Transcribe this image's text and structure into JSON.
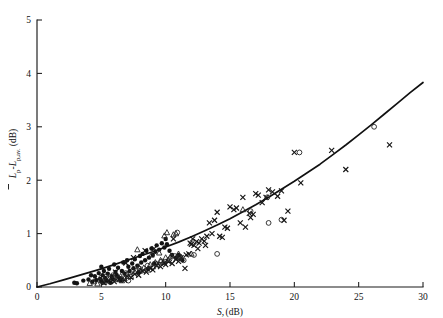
{
  "chart_data": {
    "type": "scatter",
    "title": "",
    "xlabel": "S, (dB)",
    "xlabel_main": "S,",
    "xlabel_unit": "(dB)",
    "ylabel": "L̄p-Lp,av. (dB)",
    "ylabel_main": "L",
    "ylabel_sub1": "p",
    "ylabel_mid": "-L",
    "ylabel_sub2": "p,av.",
    "ylabel_unit": "(dB)",
    "xlim": [
      0,
      30
    ],
    "ylim": [
      0,
      5
    ],
    "xticks": [
      0,
      5,
      10,
      15,
      20,
      25,
      30
    ],
    "yticks": [
      0,
      1,
      2,
      3,
      4,
      5
    ],
    "xtick_labels": [
      "0",
      "5",
      "10",
      "15",
      "20",
      "25",
      "30"
    ],
    "ytick_labels": [
      "0",
      "1",
      "2",
      "3",
      "4",
      "5"
    ],
    "grid": false,
    "legend": "none",
    "axis_color": "#1a1a1a",
    "marker_color": "#151515",
    "curve_color": "#111111",
    "curve": {
      "name": "fitted trend",
      "description": "monotonic increasing curve from origin, slightly concave up at high S",
      "points": [
        [
          0.0,
          0.0
        ],
        [
          1.0,
          0.06
        ],
        [
          2.0,
          0.13
        ],
        [
          3.0,
          0.2
        ],
        [
          4.0,
          0.27
        ],
        [
          5.0,
          0.34
        ],
        [
          6.0,
          0.42
        ],
        [
          7.0,
          0.5
        ],
        [
          8.0,
          0.58
        ],
        [
          9.0,
          0.66
        ],
        [
          10.0,
          0.75
        ],
        [
          11.0,
          0.84
        ],
        [
          12.0,
          0.94
        ],
        [
          13.0,
          1.05
        ],
        [
          14.0,
          1.16
        ],
        [
          15.0,
          1.28
        ],
        [
          16.0,
          1.41
        ],
        [
          17.0,
          1.54
        ],
        [
          18.0,
          1.68
        ],
        [
          19.0,
          1.83
        ],
        [
          20.0,
          1.98
        ],
        [
          21.0,
          2.14
        ],
        [
          22.0,
          2.3
        ],
        [
          23.0,
          2.48
        ],
        [
          24.0,
          2.66
        ],
        [
          25.0,
          2.85
        ],
        [
          26.0,
          3.04
        ],
        [
          27.0,
          3.24
        ],
        [
          28.0,
          3.44
        ],
        [
          29.0,
          3.64
        ],
        [
          30.0,
          3.83
        ]
      ]
    },
    "series": [
      {
        "name": "filled-circle",
        "marker": "circle-filled",
        "points": [
          [
            2.9,
            0.08
          ],
          [
            3.1,
            0.07
          ],
          [
            3.6,
            0.12
          ],
          [
            4.0,
            0.14
          ],
          [
            4.3,
            0.1
          ],
          [
            4.5,
            0.2
          ],
          [
            4.6,
            0.13
          ],
          [
            4.8,
            0.26
          ],
          [
            4.9,
            0.15
          ],
          [
            5.0,
            0.1
          ],
          [
            5.1,
            0.22
          ],
          [
            5.2,
            0.3
          ],
          [
            5.3,
            0.17
          ],
          [
            5.4,
            0.12
          ],
          [
            5.5,
            0.25
          ],
          [
            5.6,
            0.34
          ],
          [
            5.8,
            0.2
          ],
          [
            5.9,
            0.15
          ],
          [
            6.0,
            0.42
          ],
          [
            6.1,
            0.28
          ],
          [
            6.2,
            0.22
          ],
          [
            6.3,
            0.36
          ],
          [
            6.4,
            0.17
          ],
          [
            6.6,
            0.3
          ],
          [
            6.7,
            0.46
          ],
          [
            6.8,
            0.25
          ],
          [
            7.0,
            0.5
          ],
          [
            7.1,
            0.38
          ],
          [
            7.2,
            0.3
          ],
          [
            7.4,
            0.44
          ],
          [
            7.5,
            0.35
          ],
          [
            7.6,
            0.52
          ],
          [
            7.8,
            0.4
          ],
          [
            8.0,
            0.58
          ],
          [
            8.1,
            0.46
          ],
          [
            8.2,
            0.62
          ],
          [
            8.4,
            0.5
          ],
          [
            8.5,
            0.68
          ],
          [
            8.7,
            0.55
          ],
          [
            8.9,
            0.72
          ],
          [
            9.0,
            0.6
          ],
          [
            9.2,
            0.66
          ],
          [
            9.3,
            0.78
          ],
          [
            9.5,
            0.7
          ],
          [
            9.7,
            0.82
          ],
          [
            9.9,
            0.74
          ],
          [
            10.0,
            0.9
          ],
          [
            10.1,
            0.8
          ],
          [
            10.3,
            0.68
          ],
          [
            10.5,
            0.6
          ],
          [
            5.0,
            0.38
          ],
          [
            5.7,
            0.08
          ],
          [
            6.5,
            0.12
          ],
          [
            4.2,
            0.22
          ],
          [
            11.0,
            0.6
          ],
          [
            11.3,
            0.5
          ],
          [
            10.8,
            0.55
          ],
          [
            7.9,
            0.28
          ],
          [
            8.6,
            0.34
          ],
          [
            9.1,
            0.44
          ]
        ]
      },
      {
        "name": "open-triangle",
        "marker": "triangle-open",
        "points": [
          [
            4.1,
            0.07
          ],
          [
            4.4,
            0.1
          ],
          [
            4.7,
            0.06
          ],
          [
            5.0,
            0.13
          ],
          [
            5.2,
            0.09
          ],
          [
            5.5,
            0.16
          ],
          [
            5.7,
            0.11
          ],
          [
            6.0,
            0.18
          ],
          [
            6.2,
            0.14
          ],
          [
            6.5,
            0.2
          ],
          [
            6.8,
            0.16
          ],
          [
            7.0,
            0.24
          ],
          [
            7.3,
            0.2
          ],
          [
            7.6,
            0.28
          ],
          [
            7.8,
            0.7
          ],
          [
            8.0,
            0.3
          ],
          [
            8.3,
            0.36
          ],
          [
            8.6,
            0.32
          ],
          [
            8.8,
            0.42
          ],
          [
            9.0,
            0.38
          ],
          [
            9.2,
            0.46
          ],
          [
            9.4,
            0.42
          ],
          [
            9.6,
            0.5
          ],
          [
            9.8,
            0.46
          ],
          [
            10.0,
            0.55
          ],
          [
            10.2,
            0.5
          ],
          [
            10.4,
            0.58
          ],
          [
            10.6,
            0.98
          ],
          [
            10.8,
            1.0
          ],
          [
            11.0,
            0.62
          ],
          [
            11.2,
            0.56
          ],
          [
            12.0,
            0.62
          ],
          [
            10.1,
            1.02
          ],
          [
            9.9,
            0.96
          ],
          [
            8.9,
            0.6
          ],
          [
            9.5,
            0.64
          ],
          [
            10.9,
            0.55
          ],
          [
            6.6,
            0.12
          ],
          [
            7.9,
            0.38
          ],
          [
            16.0,
            1.45
          ]
        ]
      },
      {
        "name": "cross",
        "marker": "cross",
        "points": [
          [
            5.2,
            0.08
          ],
          [
            5.6,
            0.12
          ],
          [
            6.0,
            0.1
          ],
          [
            6.4,
            0.15
          ],
          [
            6.8,
            0.13
          ],
          [
            7.0,
            0.2
          ],
          [
            7.3,
            0.18
          ],
          [
            7.6,
            0.24
          ],
          [
            7.9,
            0.22
          ],
          [
            8.2,
            0.3
          ],
          [
            8.5,
            0.28
          ],
          [
            8.8,
            0.35
          ],
          [
            9.0,
            0.32
          ],
          [
            9.3,
            0.4
          ],
          [
            9.6,
            0.38
          ],
          [
            9.9,
            0.45
          ],
          [
            10.0,
            0.42
          ],
          [
            10.2,
            0.48
          ],
          [
            10.5,
            0.44
          ],
          [
            10.8,
            0.52
          ],
          [
            11.0,
            0.48
          ],
          [
            11.2,
            0.55
          ],
          [
            11.5,
            0.35
          ],
          [
            11.8,
            0.62
          ],
          [
            12.0,
            0.8
          ],
          [
            12.2,
            0.78
          ],
          [
            12.4,
            0.85
          ],
          [
            12.6,
            0.82
          ],
          [
            12.8,
            0.9
          ],
          [
            13.0,
            0.86
          ],
          [
            13.2,
            0.95
          ],
          [
            13.4,
            1.2
          ],
          [
            13.6,
            1.0
          ],
          [
            14.0,
            1.4
          ],
          [
            14.2,
            0.95
          ],
          [
            14.4,
            0.93
          ],
          [
            14.6,
            1.12
          ],
          [
            14.8,
            1.1
          ],
          [
            15.0,
            1.5
          ],
          [
            15.3,
            1.45
          ],
          [
            15.8,
            1.2
          ],
          [
            16.0,
            1.68
          ],
          [
            16.2,
            1.12
          ],
          [
            16.5,
            1.38
          ],
          [
            16.8,
            1.36
          ],
          [
            17.0,
            1.75
          ],
          [
            17.2,
            1.72
          ],
          [
            17.5,
            1.58
          ],
          [
            17.8,
            1.68
          ],
          [
            18.0,
            1.82
          ],
          [
            18.3,
            1.78
          ],
          [
            18.7,
            1.7
          ],
          [
            19.0,
            1.8
          ],
          [
            19.2,
            1.25
          ],
          [
            19.5,
            1.42
          ],
          [
            20.0,
            2.52
          ],
          [
            20.5,
            1.95
          ],
          [
            22.9,
            2.56
          ],
          [
            24.0,
            2.2
          ],
          [
            27.4,
            2.66
          ],
          [
            30.8,
            4.12
          ],
          [
            12.1,
            0.9
          ],
          [
            13.8,
            1.25
          ],
          [
            11.6,
            0.6
          ],
          [
            10.6,
            0.9
          ],
          [
            9.1,
            0.72
          ],
          [
            8.4,
            0.68
          ],
          [
            7.5,
            0.55
          ],
          [
            6.9,
            0.45
          ],
          [
            6.1,
            0.28
          ],
          [
            11.9,
            0.82
          ],
          [
            12.5,
            0.72
          ],
          [
            13.1,
            0.78
          ],
          [
            15.5,
            1.48
          ],
          [
            16.6,
            1.3
          ]
        ]
      },
      {
        "name": "open-circle",
        "marker": "circle-open",
        "points": [
          [
            5.0,
            0.18
          ],
          [
            5.4,
            0.2
          ],
          [
            5.9,
            0.22
          ],
          [
            6.3,
            0.16
          ],
          [
            6.9,
            0.26
          ],
          [
            7.4,
            0.3
          ],
          [
            8.0,
            0.34
          ],
          [
            8.6,
            0.4
          ],
          [
            9.2,
            0.44
          ],
          [
            9.7,
            0.48
          ],
          [
            10.3,
            0.52
          ],
          [
            10.7,
            0.58
          ],
          [
            10.9,
            1.02
          ],
          [
            11.1,
            0.56
          ],
          [
            14.0,
            0.62
          ],
          [
            16.6,
            1.42
          ],
          [
            17.9,
            1.68
          ],
          [
            18.0,
            1.2
          ],
          [
            19.0,
            1.26
          ],
          [
            20.4,
            2.52
          ],
          [
            26.2,
            3.0
          ],
          [
            11.4,
            0.5
          ],
          [
            12.2,
            0.6
          ],
          [
            7.1,
            0.12
          ]
        ]
      }
    ]
  }
}
